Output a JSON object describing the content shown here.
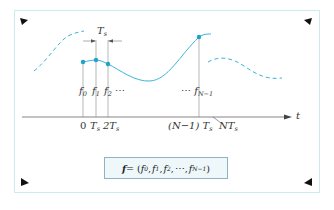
{
  "figure": {
    "type": "sampling-diagram",
    "colors": {
      "signal": "#3bb4d6",
      "sample_dot": "#1fa2c8",
      "axis": "#666666",
      "frame": "#cdeaf0",
      "formula_box_fill": "#eef7fa",
      "formula_box_border": "#8fb3c2",
      "corner_marks": "#111111"
    },
    "axis": {
      "label": "t"
    },
    "interval": {
      "label": "T",
      "label_sub": "s"
    },
    "samples": [
      {
        "label": "f",
        "sub": "0"
      },
      {
        "label": "f",
        "sub": "1"
      },
      {
        "label": "f",
        "sub": "2"
      },
      {
        "label": "f",
        "sub": "N−1"
      }
    ],
    "sample_ellipsis_mid": "⋯",
    "sample_ellipsis_last": "⋯",
    "ticks": [
      {
        "text": "0",
        "sub": ""
      },
      {
        "text": "T",
        "sub": "s"
      },
      {
        "text": "2T",
        "sub": "s"
      },
      {
        "text": "(N−1) T",
        "sub": "s"
      },
      {
        "text": "NT",
        "sub": "s"
      }
    ],
    "formula": {
      "lhs": "f",
      "eq": "= (",
      "terms": [
        {
          "base": "f",
          "sub": "0"
        },
        {
          "base": "f",
          "sub": "1"
        },
        {
          "base": "f",
          "sub": "2"
        }
      ],
      "ellipsis": "⋯",
      "last": {
        "base": "f",
        "sub": "N−1"
      },
      "close": ")"
    }
  }
}
